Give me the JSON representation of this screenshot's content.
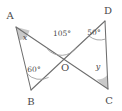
{
  "figure": {
    "kind": "geometry-diagram",
    "background_color": "#ffffff",
    "line_color": "#6e6e6e",
    "arc_color": "#9a9a9a",
    "wedge_fill": "#c9c9c9",
    "text_color": "#4a4a4a",
    "vertices": [
      {
        "id": "A",
        "label": "A",
        "x": 16,
        "y": 27,
        "label_x": 10,
        "label_y": 16
      },
      {
        "id": "B",
        "label": "B",
        "x": 31,
        "y": 90,
        "label_x": 31,
        "label_y": 102
      },
      {
        "id": "C",
        "label": "C",
        "x": 108,
        "y": 89,
        "label_x": 109,
        "label_y": 101
      },
      {
        "id": "D",
        "label": "D",
        "x": 105,
        "y": 21,
        "label_x": 108,
        "label_y": 11
      },
      {
        "id": "O",
        "label": "O",
        "x": 62,
        "y": 59,
        "label_x": 65,
        "label_y": 68
      }
    ],
    "segments": [
      {
        "id": "AC",
        "from": "A",
        "to": "C",
        "path": "M16,27 L108,89"
      },
      {
        "id": "BD",
        "from": "B",
        "to": "D",
        "path": "M31,90 L105,21"
      },
      {
        "id": "AB",
        "from": "A",
        "to": "B",
        "path": "M16,27 L31,90"
      },
      {
        "id": "DC",
        "from": "D",
        "to": "C",
        "path": "M105,21 L108,89"
      }
    ],
    "angles": [
      {
        "id": "angle-A",
        "at": "A",
        "label": "x",
        "label_kind": "variable",
        "label_x": 25,
        "label_y": 38,
        "mark": "filled-wedge",
        "wedge_path": "M16,27 L29.6,30.6 A14,14 0 0,1 19.3,40.6 Z"
      },
      {
        "id": "angle-B",
        "at": "B",
        "label": "60°",
        "label_kind": "measure",
        "value": 60,
        "label_x": 34,
        "label_y": 70,
        "mark": "arc",
        "arc_path": "M26.7,73.3 A18,18 0 0,0 48.6,77.4"
      },
      {
        "id": "angle-O",
        "at": "O",
        "label": "105°",
        "label_kind": "measure",
        "value": 105,
        "label_x": 62,
        "label_y": 34,
        "mark": "arc",
        "arc_path": "M47.3,49.1 A19,19 0 0,0 76.5,47.8"
      },
      {
        "id": "angle-D",
        "at": "D",
        "label": "50°",
        "label_kind": "measure",
        "value": 50,
        "label_x": 94,
        "label_y": 33,
        "mark": "arc",
        "arc_path": "M88.9,36.0 A18,18 0 0,0 105.8,39.0"
      },
      {
        "id": "angle-C",
        "at": "C",
        "label": "y",
        "label_kind": "variable",
        "label_x": 98,
        "label_y": 67,
        "mark": "filled-wedge",
        "wedge_path": "M108,89 L107.4,75.0 A14,14 0 0,1 96.4,79.6 Z"
      }
    ]
  }
}
